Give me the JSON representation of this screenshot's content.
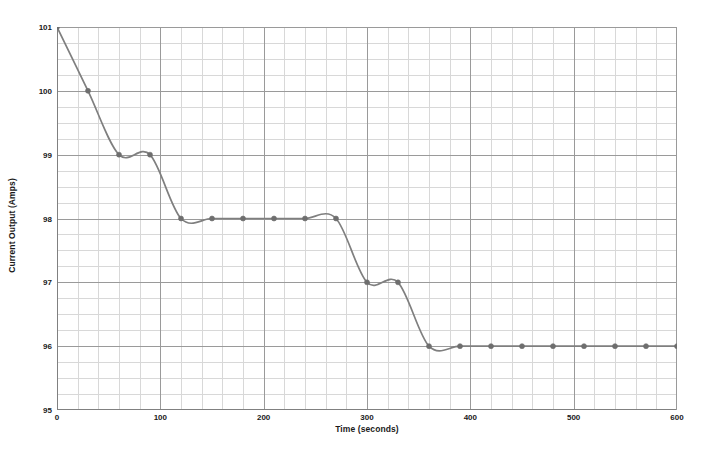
{
  "chart_data": {
    "type": "line",
    "title": "",
    "xlabel": "Time (seconds)",
    "ylabel": "Current Output (Amps)",
    "xlim": [
      0,
      600
    ],
    "ylim": [
      95,
      101
    ],
    "x_ticks": [
      0,
      100,
      200,
      300,
      400,
      500,
      600
    ],
    "y_ticks": [
      95,
      96,
      97,
      98,
      99,
      100,
      101
    ],
    "x_tick_labels": [
      "0",
      "100",
      "200",
      "300",
      "400",
      "500",
      "600"
    ],
    "y_tick_labels": [
      "95",
      "96",
      "97",
      "98",
      "99",
      "100",
      "101"
    ],
    "x_minor_step": 20,
    "y_minor_step": 0.25,
    "grid": true,
    "grid_minor": true,
    "legend": false,
    "smoothing": "spline",
    "line_color": "#7f7f7f",
    "marker_color": "#6e6e6e",
    "marker_shape": "circle",
    "grid_major_color": "#9a9a9a",
    "grid_minor_color": "#d8d8d8",
    "axis_color": "#808080",
    "background": "#ffffff",
    "text_color": "#1a1a1a",
    "series": [
      {
        "name": "Current Output",
        "x": [
          0,
          30,
          60,
          90,
          120,
          150,
          180,
          210,
          240,
          270,
          300,
          330,
          360,
          390,
          420,
          450,
          480,
          510,
          540,
          570,
          600
        ],
        "values": [
          101,
          100,
          99,
          99,
          98,
          98,
          98,
          98,
          98,
          98,
          97,
          97,
          96,
          96,
          96,
          96,
          96,
          96,
          96,
          96,
          96
        ]
      }
    ]
  },
  "axes": {
    "y_title": "Current Output (Amps)",
    "x_title": "Time (seconds)"
  }
}
